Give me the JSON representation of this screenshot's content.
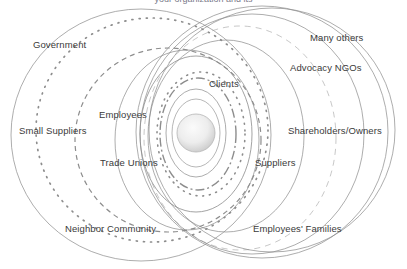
{
  "figure": {
    "type": "concentric-overlapping-circles",
    "title_partial": "your organization and its",
    "title_visible": false,
    "background_color": "#ffffff",
    "text_color": "#3a3a3a",
    "stroke_color": "#8d8d8d",
    "core_fill_light": "#f2f2f2",
    "core_fill_dark": "#c9c9c9"
  },
  "core": {
    "name": "organization-core",
    "cx": 196,
    "cy": 133,
    "r": 19,
    "label": ""
  },
  "labels": [
    {
      "id": "government",
      "text": "Government",
      "x": 33,
      "y": 40,
      "align": "left"
    },
    {
      "id": "many-others",
      "text": "Many others",
      "x": 310,
      "y": 33,
      "align": "left"
    },
    {
      "id": "advocacy-ngos",
      "text": "Advocacy NGOs",
      "x": 290,
      "y": 63,
      "align": "left"
    },
    {
      "id": "clients",
      "text": "Clients",
      "x": 209,
      "y": 79,
      "align": "left"
    },
    {
      "id": "employees",
      "text": "Employees",
      "x": 99,
      "y": 110,
      "align": "left"
    },
    {
      "id": "small-suppliers",
      "text": "Small Suppliers",
      "x": 19,
      "y": 126,
      "align": "left"
    },
    {
      "id": "shareholders-owners",
      "text": "Shareholders/Owners",
      "x": 288,
      "y": 126,
      "align": "left"
    },
    {
      "id": "trade-unions",
      "text": "Trade Unions",
      "x": 100,
      "y": 158,
      "align": "left"
    },
    {
      "id": "suppliers",
      "text": "Suppliers",
      "x": 255,
      "y": 158,
      "align": "left"
    },
    {
      "id": "neighbor-community",
      "text": "Neighbor Community",
      "x": 65,
      "y": 224,
      "align": "left"
    },
    {
      "id": "employees-families",
      "text": "Employees' Families",
      "x": 253,
      "y": 224,
      "align": "left"
    }
  ],
  "rings": [
    {
      "id": "ring-small-suppliers",
      "cx": 141,
      "cy": 135,
      "rx": 130,
      "ry": 126,
      "style": "solid",
      "width": 0.8
    },
    {
      "id": "ring-government",
      "cx": 152,
      "cy": 130,
      "rx": 116,
      "ry": 112,
      "style": "dotted",
      "width": 1.7
    },
    {
      "id": "ring-employees",
      "cx": 168,
      "cy": 140,
      "rx": 93,
      "ry": 92,
      "style": "dashed",
      "width": 1.2
    },
    {
      "id": "ring-trade-unions",
      "cx": 187,
      "cy": 140,
      "rx": 72,
      "ry": 90,
      "style": "solid",
      "width": 0.8
    },
    {
      "id": "ring-clients-outer",
      "cx": 196,
      "cy": 134,
      "rx": 56,
      "ry": 78,
      "style": "solid",
      "width": 0.9
    },
    {
      "id": "ring-clients-dotted",
      "cx": 201,
      "cy": 134,
      "rx": 44,
      "ry": 62,
      "style": "dotted",
      "width": 1.6
    },
    {
      "id": "ring-inner-dashdot",
      "cx": 198,
      "cy": 134,
      "rx": 38,
      "ry": 56,
      "style": "dashdot",
      "width": 1.4
    },
    {
      "id": "ring-inner-thin",
      "cx": 196,
      "cy": 133,
      "rx": 30,
      "ry": 44,
      "style": "solid",
      "width": 0.8
    },
    {
      "id": "ring-core-halo",
      "cx": 196,
      "cy": 133,
      "rx": 24,
      "ry": 34,
      "style": "solid",
      "width": 0.7
    },
    {
      "id": "ring-suppliers",
      "cx": 226,
      "cy": 136,
      "rx": 78,
      "ry": 96,
      "style": "solid",
      "width": 0.8
    },
    {
      "id": "ring-employees-families",
      "cx": 240,
      "cy": 138,
      "rx": 96,
      "ry": 112,
      "style": "dashed-light",
      "width": 0.9
    },
    {
      "id": "ring-shareholders",
      "cx": 252,
      "cy": 134,
      "rx": 112,
      "ry": 120,
      "style": "solid",
      "width": 0.8
    },
    {
      "id": "ring-advocacy-ngos",
      "cx": 262,
      "cy": 132,
      "rx": 126,
      "ry": 126,
      "style": "solid",
      "width": 0.8
    },
    {
      "id": "ring-many-others",
      "cx": 272,
      "cy": 130,
      "rx": 123,
      "ry": 122,
      "style": "solid",
      "width": 0.8
    }
  ]
}
